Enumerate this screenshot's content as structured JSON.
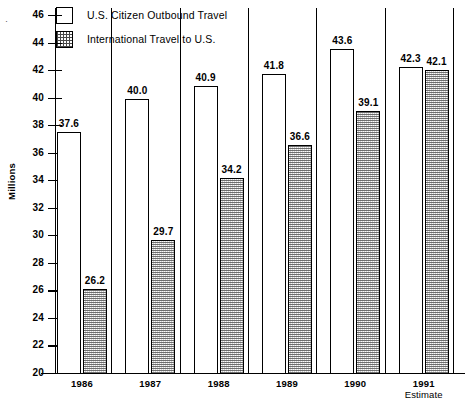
{
  "chart_data": {
    "type": "bar",
    "title": "",
    "xlabel": "",
    "ylabel": "Millions",
    "ylim": [
      20,
      46
    ],
    "ytick_step": 2,
    "yticks": [
      46,
      44,
      42,
      40,
      38,
      36,
      34,
      32,
      30,
      28,
      26,
      24,
      22,
      20
    ],
    "grid": false,
    "legend_position": "top-left",
    "categories": [
      "1986",
      "1987",
      "1988",
      "1989",
      "1990",
      "1991"
    ],
    "category_sublabels": [
      "",
      "",
      "",
      "",
      "",
      "Estimate"
    ],
    "series": [
      {
        "name": "U.S. Citizen Outbound Travel",
        "style": "open",
        "values": [
          37.6,
          40.0,
          40.9,
          41.8,
          43.6,
          42.3
        ],
        "labels": [
          "37.6",
          "40.0",
          "40.9",
          "41.8",
          "43.6",
          "42.3"
        ]
      },
      {
        "name": "International Travel to U.S.",
        "style": "hatched",
        "values": [
          26.2,
          29.7,
          34.2,
          36.6,
          39.1,
          42.1
        ],
        "labels": [
          "26.2",
          "29.7",
          "34.2",
          "36.6",
          "39.1",
          "42.1"
        ]
      }
    ],
    "annotations": []
  },
  "legend": {
    "items": [
      {
        "label": "U.S. Citizen Outbound Travel",
        "swatch": "open-square-icon"
      },
      {
        "label": "International Travel to U.S.",
        "swatch": "grid-pattern-square-icon"
      }
    ]
  },
  "axes": {
    "y_title": "Millions",
    "y_tick_labels": [
      "46",
      "44",
      "42",
      "40",
      "38",
      "36",
      "34",
      "32",
      "30",
      "28",
      "26",
      "24",
      "22",
      "20"
    ],
    "x_tick_labels": [
      "1986",
      "1987",
      "1988",
      "1989",
      "1990",
      "1991"
    ],
    "x_tick_sublabels": [
      "",
      "",
      "",
      "",
      "",
      "Estimate"
    ]
  },
  "colors": {
    "axis": "#000000",
    "open_bar_fill": "#ffffff",
    "hatched_bar_fill": "#cfcfcf",
    "text": "#000000"
  },
  "marks": {
    "corner_mark": "·"
  }
}
